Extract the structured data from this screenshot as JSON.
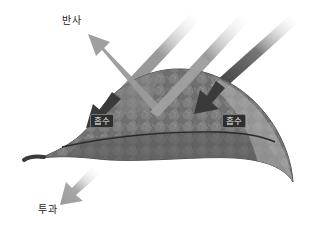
{
  "diagram": {
    "title": "",
    "labels": {
      "reflection": "반사",
      "absorption_left": "흡수",
      "absorption_right": "흡수",
      "transmission": "투과"
    },
    "arrows": [
      {
        "name": "incoming-light-left",
        "direction": "down-left",
        "role": "incident"
      },
      {
        "name": "incoming-light-center",
        "direction": "down-left",
        "role": "incident"
      },
      {
        "name": "incoming-light-right",
        "direction": "down-left",
        "role": "incident"
      },
      {
        "name": "reflected-light",
        "direction": "up-left",
        "role": "reflection"
      },
      {
        "name": "absorbed-light-left",
        "direction": "down-left",
        "role": "absorption"
      },
      {
        "name": "absorbed-light-right",
        "direction": "down-left",
        "role": "absorption"
      },
      {
        "name": "transmitted-light",
        "direction": "down-left",
        "role": "transmission"
      }
    ],
    "colors": {
      "leaf_dark": "#4a4a4a",
      "leaf_mid": "#7a7a7a",
      "leaf_light": "#a8a8a8",
      "arrow_light": "#9a9a9a",
      "arrow_dark": "#3a3a3a",
      "badge_bg": "#2e2e2e"
    }
  }
}
